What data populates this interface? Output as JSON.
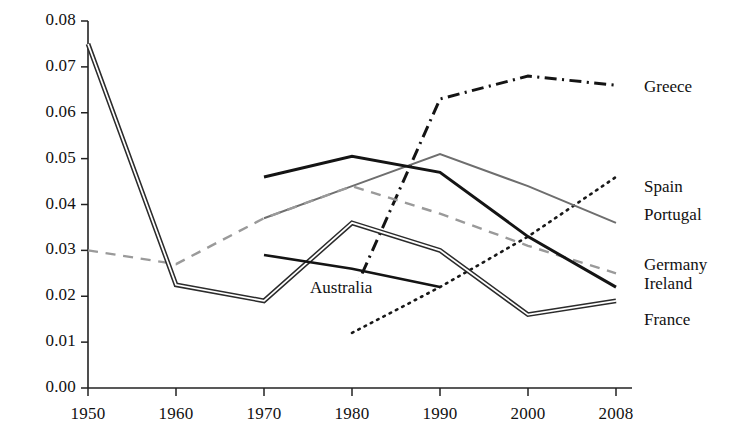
{
  "chart_data": {
    "type": "line",
    "title": "",
    "subtitle": "",
    "xlabel": "",
    "ylabel": "",
    "grid": false,
    "legend_position": "right-inline",
    "categories": [
      "1950",
      "1960",
      "1970",
      "1980",
      "1990",
      "2000",
      "2008"
    ],
    "x_ticks": [
      "1950",
      "1960",
      "1970",
      "1980",
      "1990",
      "2000",
      "2008"
    ],
    "y_ticks": [
      "0.00",
      "0.01",
      "0.02",
      "0.03",
      "0.04",
      "0.05",
      "0.06",
      "0.07",
      "0.08"
    ],
    "ylim": [
      0.0,
      0.08
    ],
    "series": [
      {
        "name": "Greece",
        "style": "dash-dot",
        "color": "#141414",
        "width": 3.0,
        "x": [
          "1980",
          "1990",
          "2000",
          "2008"
        ],
        "values": [
          0.02,
          0.063,
          0.068,
          0.066
        ]
      },
      {
        "name": "Spain",
        "style": "dotted",
        "color": "#181818",
        "width": 2.6,
        "x": [
          "1980",
          "1990",
          "2000",
          "2008"
        ],
        "values": [
          0.012,
          0.022,
          0.033,
          0.046
        ]
      },
      {
        "name": "Portugal",
        "style": "solid",
        "color": "#6e6e6e",
        "width": 2.0,
        "x": [
          "1970",
          "1980",
          "1990",
          "2000",
          "2008"
        ],
        "values": [
          0.037,
          0.044,
          0.051,
          0.044,
          0.036
        ]
      },
      {
        "name": "Germany",
        "style": "dashed",
        "color": "#9a9a9a",
        "width": 2.4,
        "x": [
          "1950",
          "1960",
          "1970",
          "1980",
          "1990",
          "2000",
          "2008"
        ],
        "values": [
          0.03,
          0.027,
          0.037,
          0.044,
          0.038,
          0.031,
          0.025
        ]
      },
      {
        "name": "Ireland",
        "style": "solid",
        "color": "#141414",
        "width": 3.0,
        "x": [
          "1970",
          "1980",
          "1990",
          "2000",
          "2008"
        ],
        "values": [
          0.046,
          0.0505,
          0.047,
          0.033,
          0.022
        ]
      },
      {
        "name": "France",
        "style": "solid-double",
        "color": "#2b2b2b",
        "width": 1.6,
        "x": [
          "1950",
          "1960",
          "1970",
          "1980",
          "1990",
          "2000",
          "2008"
        ],
        "values": [
          0.075,
          0.0225,
          0.019,
          0.036,
          0.03,
          0.016,
          0.019
        ]
      },
      {
        "name": "Australia",
        "style": "solid",
        "color": "#141414",
        "width": 2.6,
        "x": [
          "1970",
          "1980",
          "1990"
        ],
        "values": [
          0.029,
          0.026,
          0.022
        ]
      }
    ],
    "inline_labels": [
      {
        "text": "Australia",
        "x": "1980",
        "value": 0.0215
      }
    ],
    "right_labels": [
      {
        "text": "Greece",
        "value": 0.0655
      },
      {
        "text": "Spain",
        "value": 0.0435
      },
      {
        "text": "Portugal",
        "value": 0.0375
      },
      {
        "text": "Germany",
        "value": 0.0265
      },
      {
        "text": "Ireland",
        "value": 0.0225
      },
      {
        "text": "France",
        "value": 0.0145
      }
    ]
  }
}
